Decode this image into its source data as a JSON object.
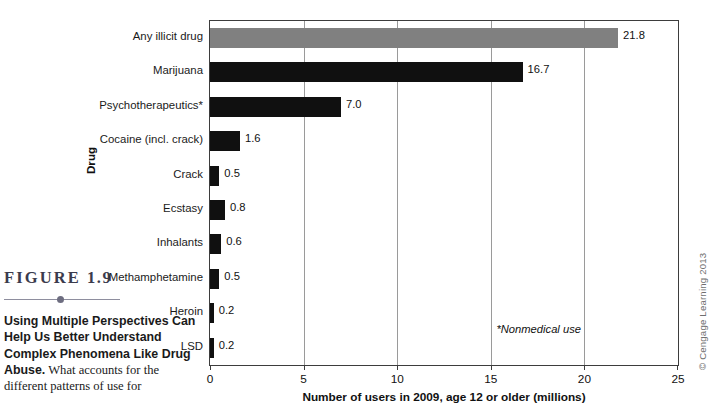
{
  "figure": {
    "label_prefix": "FIGURE",
    "label_number": "1.9",
    "caption_lead": "Using Multiple Perspectives Can Help Us Better Understand Complex Phenomena Like Drug Abuse.",
    "caption_body": " What accounts for the different patterns of use for",
    "copyright": "© Cengage Learning 2013"
  },
  "chart_data": {
    "type": "bar",
    "orientation": "horizontal",
    "title": "",
    "xlabel": "Number of users in 2009, age 12 or older (millions)",
    "ylabel": "Drug",
    "xlim": [
      0,
      25
    ],
    "xticks": [
      0,
      5,
      10,
      15,
      20,
      25
    ],
    "xtick_labels": [
      "0",
      "5",
      "10",
      "15",
      "20",
      "25"
    ],
    "grid": true,
    "grid_axis": "x",
    "legend": "none",
    "annotation": "*Nonmedical use",
    "accent_color": "#808080",
    "bar_color": "#101010",
    "categories": [
      "Any illicit drug",
      "Marijuana",
      "Psychotherapeutics*",
      "Cocaine (incl. crack)",
      "Crack",
      "Ecstasy",
      "Inhalants",
      "Methamphetamine",
      "Heroin",
      "LSD"
    ],
    "values": [
      21.8,
      16.7,
      7.0,
      1.6,
      0.5,
      0.8,
      0.6,
      0.5,
      0.2,
      0.2
    ],
    "value_labels": [
      "21.8",
      "16.7",
      "7.0",
      "1.6",
      "0.5",
      "0.8",
      "0.6",
      "0.5",
      "0.2",
      "0.2"
    ],
    "highlighted_index": 0
  }
}
